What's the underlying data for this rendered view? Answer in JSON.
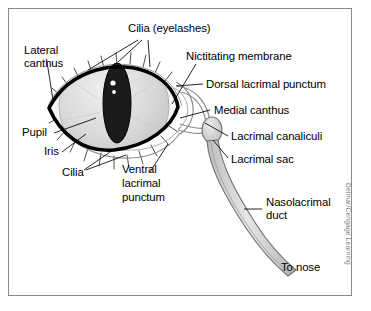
{
  "figure": {
    "credit": "Delmar/Cengage Learning",
    "frame_color": "#8a8a8a",
    "background": "#ffffff"
  },
  "colors": {
    "outline": "#000000",
    "sclera": "#f2f2f2",
    "iris": "#d8d8d8",
    "pupil": "#1a1a1a",
    "highlight": "#ffffff",
    "duct_fill": "#d4d4d4",
    "duct_stroke": "#6e6e6e",
    "leader": "#000000",
    "credit_color": "#7d7d7d"
  },
  "labels": [
    {
      "id": "cilia-eyelashes",
      "text": "Cilia (eyelashes)",
      "lines": [
        "Cilia (eyelashes)"
      ]
    },
    {
      "id": "lateral-canthus",
      "text": "Lateral canthus",
      "lines": [
        "Lateral",
        "canthus"
      ]
    },
    {
      "id": "nictitating-membrane",
      "text": "Nictitating membrane",
      "lines": [
        "Nictitating membrane"
      ]
    },
    {
      "id": "dorsal-lacrimal-punctum",
      "text": "Dorsal lacrimal punctum",
      "lines": [
        "Dorsal lacrimal punctum"
      ]
    },
    {
      "id": "medial-canthus",
      "text": "Medial canthus",
      "lines": [
        "Medial canthus"
      ]
    },
    {
      "id": "lacrimal-canaliculi",
      "text": "Lacrimal canaliculi",
      "lines": [
        "Lacrimal canaliculi"
      ]
    },
    {
      "id": "lacrimal-sac",
      "text": "Lacrimal sac",
      "lines": [
        "Lacrimal sac"
      ]
    },
    {
      "id": "nasolacrimal-duct",
      "text": "Nasolacrimal duct",
      "lines": [
        "Nasolacrimal",
        "duct"
      ]
    },
    {
      "id": "to-nose",
      "text": "To nose",
      "lines": [
        "To nose"
      ]
    },
    {
      "id": "pupil",
      "text": "Pupil",
      "lines": [
        "Pupil"
      ]
    },
    {
      "id": "iris",
      "text": "Iris",
      "lines": [
        "Iris"
      ]
    },
    {
      "id": "cilia",
      "text": "Cilia",
      "lines": [
        "Cilia"
      ]
    },
    {
      "id": "ventral-lacrimal-punctum",
      "text": "Ventral lacrimal punctum",
      "lines": [
        "Ventral",
        "lacrimal",
        "punctum"
      ]
    }
  ],
  "text": {
    "cilia_eyelashes": "Cilia (eyelashes)",
    "lateral_l1": "Lateral",
    "lateral_l2": "canthus",
    "nictitating": "Nictitating membrane",
    "dorsal_punctum": "Dorsal lacrimal punctum",
    "medial_canthus": "Medial canthus",
    "canaliculi": "Lacrimal canaliculi",
    "lacrimal_sac": "Lacrimal sac",
    "naso_l1": "Nasolacrimal",
    "naso_l2": "duct",
    "to_nose": "To nose",
    "pupil": "Pupil",
    "iris": "Iris",
    "cilia": "Cilia",
    "ventral_l1": "Ventral",
    "ventral_l2": "lacrimal",
    "ventral_l3": "punctum",
    "credit": "Delmar/Cengage Learning"
  }
}
